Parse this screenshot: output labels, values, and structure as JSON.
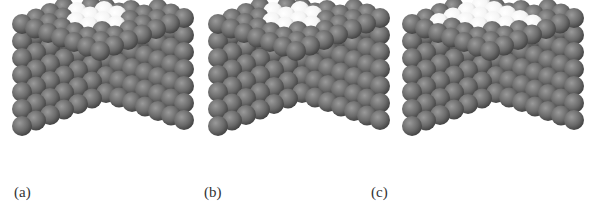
{
  "figure": {
    "panels": [
      {
        "id": "a",
        "label": "(a)",
        "left": 0,
        "label_x": 14,
        "highlight": [
          [
            3,
            1
          ],
          [
            3,
            2
          ],
          [
            2,
            2
          ],
          [
            4,
            2
          ],
          [
            3,
            3
          ],
          [
            4,
            3
          ],
          [
            2,
            3
          ],
          [
            3,
            4
          ]
        ]
      },
      {
        "id": "b",
        "label": "(b)",
        "left": 196,
        "label_x": -6,
        "highlight": [
          [
            3,
            1
          ],
          [
            3,
            2
          ],
          [
            2,
            2
          ],
          [
            4,
            2
          ],
          [
            3,
            3
          ],
          [
            4,
            3
          ],
          [
            2,
            3
          ],
          [
            3,
            4
          ]
        ]
      },
      {
        "id": "c",
        "label": "(c)",
        "left": 390,
        "label_x": -33,
        "highlight": [
          [
            1,
            1
          ],
          [
            2,
            1
          ],
          [
            3,
            1
          ],
          [
            4,
            1
          ],
          [
            5,
            1
          ],
          [
            2,
            2
          ],
          [
            3,
            2
          ],
          [
            4,
            2
          ],
          [
            5,
            2
          ],
          [
            2,
            3
          ],
          [
            3,
            3
          ],
          [
            4,
            3
          ],
          [
            3,
            4
          ],
          [
            4,
            4
          ],
          [
            4,
            5
          ]
        ]
      }
    ],
    "colors": {
      "atom": "#6a6a6a",
      "atom_shadow": "#3e3e3e",
      "atom_highlight_light": "#f4f4f4",
      "atom_highlight_dark": "#b8b8b8",
      "background": "#ffffff"
    }
  }
}
